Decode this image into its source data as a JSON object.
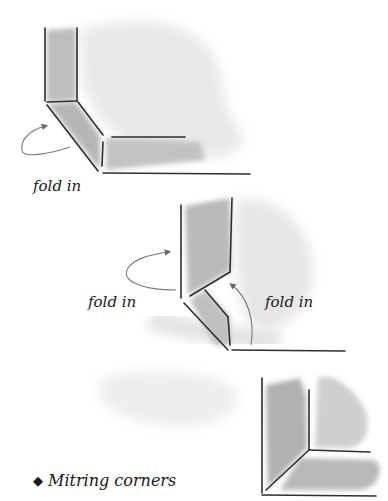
{
  "illustration": {
    "step1": {
      "label": "fold in"
    },
    "step2": {
      "label_left": "fold in",
      "label_right": "fold in"
    },
    "step3": {}
  },
  "caption": {
    "bullet": "◆",
    "text": "Mitring corners"
  },
  "colors": {
    "ink": "#2a2a2a",
    "wash": "#b8b8b8",
    "arrow": "#777777"
  }
}
